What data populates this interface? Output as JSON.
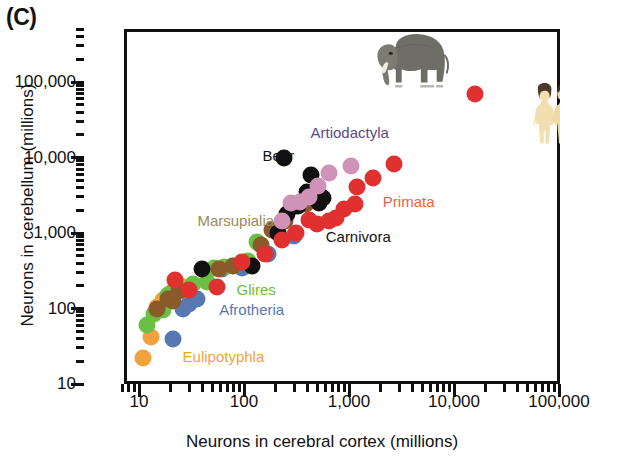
{
  "panel": {
    "letter": "(C)"
  },
  "chart_data": {
    "type": "scatter",
    "title": "",
    "xlabel": "Neurons in cerebral cortex (millions)",
    "ylabel": "Neurons in cerebellum (millions)",
    "xscale": "log",
    "yscale": "log",
    "xlim": [
      5,
      100000
    ],
    "ylim": [
      10,
      400000
    ],
    "grid": false,
    "legend_position": "inline-annotations",
    "xticks": [
      10,
      100,
      1000,
      10000,
      100000
    ],
    "xtick_labels": [
      "10",
      "100",
      "1,000",
      "10,000",
      "100,000"
    ],
    "yticks": [
      10,
      100,
      1000,
      10000,
      100000
    ],
    "ytick_labels": [
      "10",
      "100",
      "1,000",
      "10,000",
      "100,000"
    ],
    "series": [
      {
        "name": "Eulipotyphla",
        "color": "#f0a33c",
        "label_color": "#f0a33c",
        "label_x": 26,
        "label_y": 23,
        "points": [
          [
            11,
            22
          ],
          [
            13,
            42
          ],
          [
            15,
            105
          ],
          [
            17,
            130
          ],
          [
            20,
            160
          ],
          [
            22,
            175
          ],
          [
            26,
            190
          ]
        ]
      },
      {
        "name": "Afrotheria",
        "color": "#5878b4",
        "label_color": "#5878b4",
        "label_x": 58,
        "label_y": 95,
        "points": [
          [
            21,
            40
          ],
          [
            26,
            100
          ],
          [
            30,
            115
          ],
          [
            36,
            135
          ],
          [
            62,
            330
          ],
          [
            95,
            340
          ],
          [
            170,
            520
          ],
          [
            300,
            900
          ],
          [
            5500,
            260000
          ]
        ]
      },
      {
        "name": "Glires",
        "color": "#6cbe45",
        "label_color": "#6cbe45",
        "label_x": 85,
        "label_y": 175,
        "points": [
          [
            12,
            60
          ],
          [
            14,
            85
          ],
          [
            17,
            95
          ],
          [
            19,
            150
          ],
          [
            22,
            180
          ],
          [
            26,
            175
          ],
          [
            33,
            210
          ],
          [
            44,
            225
          ],
          [
            52,
            340
          ],
          [
            64,
            350
          ],
          [
            78,
            360
          ],
          [
            108,
            430
          ],
          [
            133,
            760
          ],
          [
            200,
            1050
          ],
          [
            290,
            2200
          ]
        ]
      },
      {
        "name": "Marsupialia",
        "color": "#8a5a2b",
        "label_color": "#9b8a58",
        "label_x": 36,
        "label_y": 1450,
        "points": [
          [
            15,
            100
          ],
          [
            19,
            135
          ],
          [
            21,
            125
          ],
          [
            24,
            170
          ],
          [
            58,
            330
          ],
          [
            78,
            370
          ],
          [
            145,
            700
          ],
          [
            185,
            1100
          ],
          [
            245,
            1450
          ],
          [
            390,
            2400
          ]
        ]
      },
      {
        "name": "Carnivora",
        "color": "#111111",
        "label_color": "#111111",
        "label_x": 600,
        "label_y": 880,
        "points": [
          [
            40,
            330
          ],
          [
            118,
            360
          ],
          [
            210,
            1000
          ],
          [
            255,
            1800
          ],
          [
            330,
            2300
          ],
          [
            395,
            3500
          ],
          [
            430,
            5900
          ],
          [
            520,
            2500
          ],
          [
            560,
            2900
          ]
        ]
      },
      {
        "name": "Bear",
        "color": "#111111",
        "label_color": "#111111",
        "label_x": 150,
        "label_y": 10500,
        "points": [
          [
            240,
            9900
          ]
        ]
      },
      {
        "name": "Artiodactyla",
        "color": "#cf93b8",
        "label_color": "#5b4a8a",
        "label_x": 430,
        "label_y": 21000,
        "points": [
          [
            230,
            1450
          ],
          [
            280,
            2500
          ],
          [
            340,
            2600
          ],
          [
            420,
            3000
          ],
          [
            505,
            4200
          ],
          [
            640,
            6200
          ],
          [
            1050,
            7600
          ]
        ]
      },
      {
        "name": "Primata",
        "color": "#e03030",
        "label_color": "#f0604a",
        "label_x": 2100,
        "label_y": 2600,
        "points": [
          [
            22,
            240
          ],
          [
            30,
            175
          ],
          [
            55,
            190
          ],
          [
            95,
            410
          ],
          [
            160,
            520
          ],
          [
            230,
            800
          ],
          [
            310,
            1000
          ],
          [
            420,
            1500
          ],
          [
            500,
            1300
          ],
          [
            640,
            1450
          ],
          [
            760,
            1600
          ],
          [
            900,
            2100
          ],
          [
            1150,
            2400
          ],
          [
            1200,
            4100
          ],
          [
            1700,
            5300
          ],
          [
            2700,
            8200
          ],
          [
            16000,
            69000
          ]
        ]
      }
    ],
    "pictograms": [
      {
        "name": "elephant",
        "x_px": 370,
        "y_px": 30,
        "w_px": 85,
        "h_px": 60,
        "species": "African elephant"
      },
      {
        "name": "human-pair",
        "x_px": 524,
        "y_px": 83,
        "w_px": 48,
        "h_px": 63,
        "species": "Homo sapiens"
      }
    ]
  }
}
